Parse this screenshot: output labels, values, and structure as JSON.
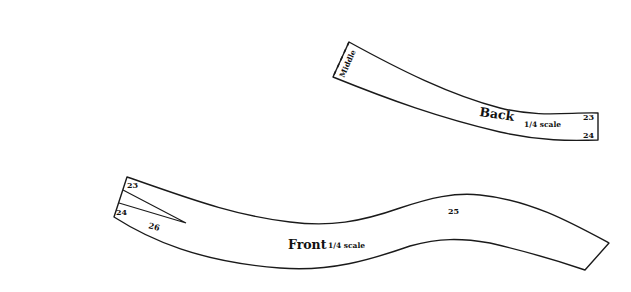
{
  "diagram": {
    "type": "sewing-pattern-pieces",
    "colors": {
      "background": "#ffffff",
      "line": "#1a1a1a",
      "text": "#111111"
    },
    "pieces": [
      {
        "name": "Back",
        "title": "Back",
        "scale_label": "1/4 scale",
        "edge_label": "Middle",
        "points": [
          "23",
          "24"
        ]
      },
      {
        "name": "Front",
        "title": "Front",
        "scale_label": "1/4 scale",
        "points": [
          "23",
          "24",
          "26",
          "25"
        ]
      }
    ]
  }
}
